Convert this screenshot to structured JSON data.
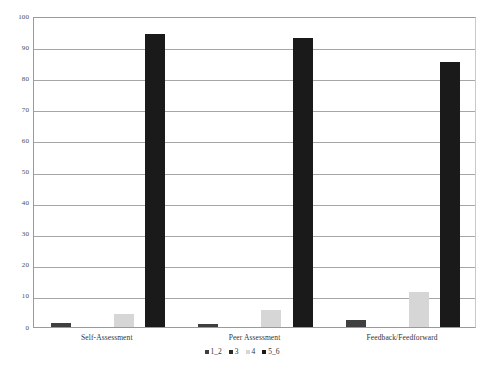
{
  "chart_data": {
    "type": "bar",
    "title": "",
    "subtitle": "",
    "xlabel": "",
    "ylabel": "",
    "categories": [
      "Self-Assessment",
      "Peer Assessment",
      "Feedback/Feedforward"
    ],
    "series": [
      {
        "name": "1_2",
        "color": "#3f3f3f",
        "values": [
          1.2,
          1.1,
          2.4
        ]
      },
      {
        "name": "3",
        "color": "#2b2b2b",
        "values": [
          0,
          0,
          0
        ]
      },
      {
        "name": "4",
        "color": "#d6d6d6",
        "values": [
          4.1,
          5.4,
          11.1
        ]
      },
      {
        "name": "5_6",
        "color": "#1a1a1a",
        "values": [
          94.2,
          92.8,
          85.3
        ]
      }
    ],
    "ylim": [
      0,
      100
    ],
    "yticks": [
      0,
      10,
      20,
      30,
      40,
      50,
      60,
      70,
      80,
      90,
      100
    ],
    "ytick_labels": [
      "0",
      "10",
      "20",
      "30",
      "40",
      "50",
      "60",
      "70",
      "80",
      "90",
      "100"
    ],
    "grid": true,
    "legend_position": "bottom",
    "legend_entries": [
      "1_2",
      "3",
      "4",
      "5_6"
    ]
  },
  "colors": {
    "plot_background": "#ffffff",
    "gridline": "#a6a6a6",
    "axis": "#9a9a9a",
    "text": "#333333"
  }
}
